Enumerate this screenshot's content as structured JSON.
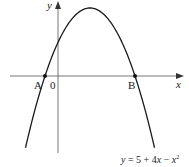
{
  "chart_data": {
    "type": "line",
    "title": "",
    "equation": "y = 5 + 4x − x²",
    "xlabel": "x",
    "ylabel": "y",
    "origin_label": "0",
    "points": [
      {
        "name": "A",
        "x": -1,
        "y": 0
      },
      {
        "name": "B",
        "x": 5,
        "y": 0
      }
    ],
    "vertex": {
      "x": 2,
      "y": 9
    },
    "y_intercept": {
      "x": 0,
      "y": 5
    },
    "xlim": [
      -3.3,
      8.2
    ],
    "ylim": [
      -10.1,
      10
    ],
    "grid": false,
    "series": [
      {
        "name": "y = 5 + 4x - x^2",
        "coefficients": {
          "a": -1,
          "b": 4,
          "c": 5
        },
        "x_range": [
          -2.3,
          6.3
        ]
      }
    ]
  },
  "labels": {
    "x_axis": "x",
    "y_axis": "y",
    "origin": "0",
    "point_a": "A",
    "point_b": "B",
    "equation_prefix": "y",
    "equation_rest": " = 5 + 4",
    "equation_x": "x",
    "equation_minus": " − ",
    "equation_x2": "x",
    "equation_sup": "2"
  },
  "colors": {
    "curve": "#1a1a1a",
    "axes": "#555555"
  }
}
